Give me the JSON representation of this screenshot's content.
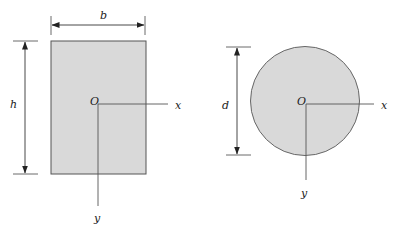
{
  "colors": {
    "background": "#ffffff",
    "section_fill": "#d9d9d9",
    "section_stroke": "#555555",
    "line": "#333333",
    "axis_line": "#555555",
    "text": "#222222"
  },
  "rectangle_section": {
    "shape": "rectangle",
    "width_label": "b",
    "height_label": "h",
    "origin_label": "O",
    "x_axis_label": "x",
    "y_axis_label": "y"
  },
  "circle_section": {
    "shape": "circle",
    "diameter_label": "d",
    "origin_label": "O",
    "x_axis_label": "x",
    "y_axis_label": "y"
  }
}
